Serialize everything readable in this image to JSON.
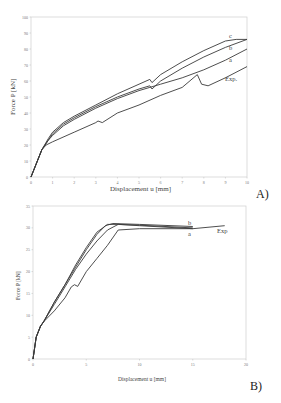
{
  "chart_data": [
    {
      "panel": "A)",
      "type": "line",
      "title": "",
      "xlabel": "Displacement u [mm]",
      "ylabel": "Force P [kN]",
      "xlim": [
        0,
        10
      ],
      "ylim": [
        0,
        100
      ],
      "xticks": [
        0,
        1,
        2,
        3,
        4,
        5,
        6,
        7,
        8,
        9,
        10
      ],
      "yticks": [
        0,
        10,
        20,
        30,
        40,
        50,
        60,
        70,
        80,
        90,
        100
      ],
      "grid": false,
      "series": [
        {
          "name": "c",
          "x": [
            0,
            0.5,
            0.8,
            1,
            1.5,
            2,
            3,
            4,
            5,
            5.5,
            5.6,
            6,
            7,
            8,
            9,
            9.5,
            10
          ],
          "y": [
            0,
            17,
            24,
            28,
            34,
            38,
            45,
            52,
            58,
            61,
            59,
            64,
            72,
            79,
            85,
            86,
            86
          ]
        },
        {
          "name": "b",
          "x": [
            0,
            0.5,
            0.8,
            1,
            1.5,
            2,
            3,
            4,
            5,
            5.5,
            5.6,
            6,
            7,
            8,
            9,
            10
          ],
          "y": [
            0,
            17,
            23,
            27,
            33,
            37,
            44,
            50,
            55,
            57,
            55,
            60,
            68,
            75,
            81,
            86
          ]
        },
        {
          "name": "a",
          "x": [
            0,
            0.5,
            0.8,
            1,
            1.5,
            2,
            3,
            4,
            5,
            5.5,
            6,
            7,
            8,
            9,
            10
          ],
          "y": [
            0,
            17,
            23,
            26,
            32,
            36,
            43,
            49,
            54,
            56,
            58,
            62,
            67,
            73,
            80
          ]
        },
        {
          "name": "Exp.",
          "x": [
            0,
            0.5,
            0.7,
            1,
            2,
            3,
            3.1,
            3.3,
            4,
            5,
            6,
            7,
            7.7,
            7.9,
            8.2,
            9,
            10
          ],
          "y": [
            0,
            17,
            20,
            22,
            28,
            34,
            35,
            34,
            40,
            45,
            51,
            56,
            64,
            58,
            57,
            62,
            69
          ]
        }
      ],
      "series_labels": [
        "c",
        "b",
        "a",
        "Exp."
      ]
    },
    {
      "panel": "B)",
      "type": "line",
      "title": "",
      "xlabel": "Displacement u [mm]",
      "ylabel": "Force P [kN]",
      "xlim": [
        0,
        20
      ],
      "ylim": [
        0,
        35
      ],
      "xticks": [
        0,
        5,
        10,
        15,
        20
      ],
      "yticks": [
        0,
        5,
        10,
        15,
        20,
        25,
        30,
        35
      ],
      "grid": false,
      "series": [
        {
          "name": "b",
          "x": [
            0,
            0.3,
            0.7,
            1,
            2,
            3,
            4,
            5,
            6,
            6.8,
            7.5,
            10,
            15
          ],
          "y": [
            0,
            5,
            7.5,
            8.5,
            13,
            17,
            21,
            25,
            28.5,
            30.5,
            31,
            30.8,
            30.3
          ]
        },
        {
          "name": "a",
          "x": [
            0,
            0.3,
            0.7,
            1,
            2,
            3,
            4,
            5,
            6,
            7,
            8,
            10,
            15
          ],
          "y": [
            0,
            5,
            7.5,
            8.5,
            12.5,
            16.5,
            20.5,
            24,
            27,
            29.5,
            30.8,
            30.5,
            29.8
          ]
        },
        {
          "name": "Exp.",
          "x": [
            0,
            0.3,
            0.7,
            1,
            2,
            3,
            3.6,
            3.9,
            4.2,
            5,
            6,
            7,
            8,
            10,
            15,
            18
          ],
          "y": [
            0,
            5,
            7.5,
            8.5,
            11,
            14,
            16.5,
            17,
            16.6,
            20,
            23,
            26,
            29.5,
            29.8,
            29.8,
            30.5
          ]
        },
        {
          "name": "c",
          "x": [
            0,
            0.3,
            0.7,
            1,
            2,
            3,
            4,
            5,
            6,
            7,
            8,
            10,
            15
          ],
          "y": [
            0,
            5,
            7.5,
            8.5,
            13,
            17,
            21.5,
            25.5,
            29,
            30.8,
            30.8,
            30.6,
            30
          ]
        }
      ],
      "series_labels": [
        "b",
        "a",
        "Exp."
      ]
    }
  ],
  "panel_labels": {
    "a": "A)",
    "b": "B)"
  },
  "chartA": {
    "xlabel": "Displacement u [mm]",
    "ylabel": "Force P [kN]",
    "label_c": "c",
    "label_b": "b",
    "label_a": "a",
    "label_exp": "Exp.",
    "panel": "A)"
  },
  "chartB": {
    "xlabel": "Displacement u [mm]",
    "ylabel": "Force P [kN]",
    "label_b": "b",
    "label_a": "a",
    "label_exp": "Exp",
    "panel": "B)"
  }
}
